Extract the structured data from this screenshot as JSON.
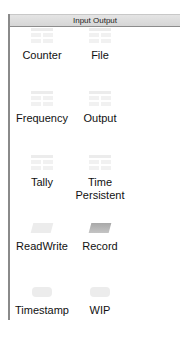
{
  "panel": {
    "title": "Input Output"
  },
  "items": [
    {
      "label": "Counter",
      "icon": "table-icon"
    },
    {
      "label": "File",
      "icon": "table-icon"
    },
    {
      "label": "Frequency",
      "icon": "table-icon"
    },
    {
      "label": "Output",
      "icon": "table-icon"
    },
    {
      "label": "Tally",
      "icon": "table-icon"
    },
    {
      "label": "Time Persistent",
      "label_line1": "Time",
      "label_line2": "Persistent",
      "icon": "table-icon"
    },
    {
      "label": "ReadWrite",
      "icon": "parallelogram-icon"
    },
    {
      "label": "Record",
      "icon": "parallelogram-icon"
    },
    {
      "label": "Timestamp",
      "icon": "rounded-rect-icon"
    },
    {
      "label": "WIP",
      "icon": "rounded-rect-icon"
    }
  ],
  "colors": {
    "header_bg": "#dcdcdc",
    "border": "#8a8a8a",
    "icon_light": "#ececec",
    "icon_dark": "#a8a8a8"
  }
}
